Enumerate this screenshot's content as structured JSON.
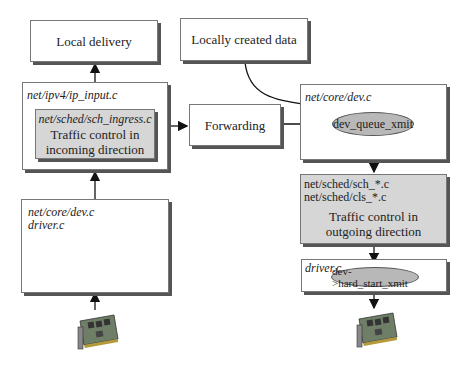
{
  "boxes": {
    "local_delivery": "Local delivery",
    "locally_created": "Locally created data",
    "ip_input": "net/ipv4/ip_input.c",
    "sch_ingress": "net/sched/sch_ingress.c",
    "ingress_tc_line1": "Traffic control in",
    "ingress_tc_line2": "incoming direction",
    "forwarding": "Forwarding",
    "core_dev_right": "net/core/dev.c",
    "dev_queue_xmit": "dev_queue_xmit",
    "core_dev_left": "net/core/dev.c",
    "driver_left": "driver.c",
    "sch_files": "net/sched/sch_*.c",
    "cls_files": "net/sched/cls_*.c",
    "egress_tc_line1": "Traffic control in",
    "egress_tc_line2": "outgoing direction",
    "driver_right": "driver.c",
    "hard_start_xmit": "dev->hard_start_xmit"
  },
  "icons": {
    "left_nic": "network-card-icon",
    "right_nic": "network-card-icon"
  }
}
